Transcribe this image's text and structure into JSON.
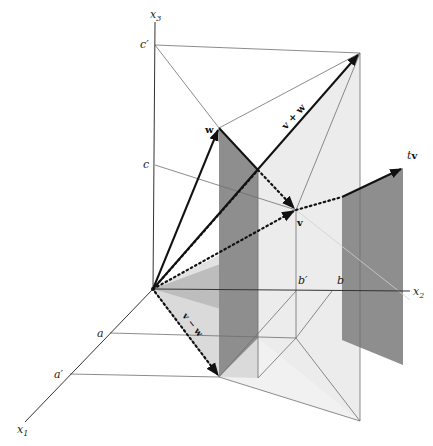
{
  "figure": {
    "type": "3D vector addition and scalar multiplication diagram",
    "colors": {
      "background": "#ffffff",
      "light_panel": "#ebebeb",
      "mid_panel": "#c4c4c4",
      "dark_panel": "#8f8f8f",
      "thin_line": "#707070",
      "vector": "#111111"
    },
    "axes": {
      "x1": {
        "label": "x",
        "sub": "1"
      },
      "x2": {
        "label": "x",
        "sub": "2"
      },
      "x3": {
        "label": "x",
        "sub": "3"
      }
    },
    "axis_marks": {
      "a": "a",
      "a_prime": "a′",
      "b": "b",
      "b_prime": "b′",
      "c": "c",
      "c_prime": "c′"
    },
    "vectors": {
      "v": "v",
      "w": "w",
      "v_plus_w": "v + w",
      "v_minus_w": "v − w",
      "tv_t": "t",
      "tv_v": "v"
    }
  }
}
